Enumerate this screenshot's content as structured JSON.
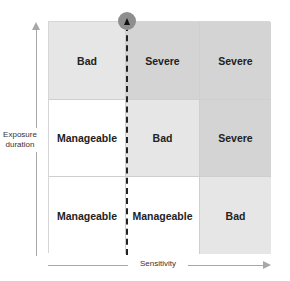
{
  "diagram": {
    "type": "risk-matrix",
    "y_axis": {
      "label": "Exposure duration",
      "label_lines": [
        "Exposure",
        "duration"
      ]
    },
    "x_axis": {
      "label": "Sensitivity"
    },
    "rows": [
      {
        "cells": [
          {
            "label": "Bad",
            "level": "bad"
          },
          {
            "label": "Severe",
            "level": "severe"
          },
          {
            "label": "Severe",
            "level": "severe"
          }
        ]
      },
      {
        "cells": [
          {
            "label": "Manageable",
            "level": "manageable"
          },
          {
            "label": "Bad",
            "level": "bad"
          },
          {
            "label": "Severe",
            "level": "severe"
          }
        ]
      },
      {
        "cells": [
          {
            "label": "Manageable",
            "level": "manageable"
          },
          {
            "label": "Manageable",
            "level": "manageable"
          },
          {
            "label": "Bad",
            "level": "bad"
          }
        ]
      }
    ],
    "colors": {
      "manageable": "#ffffff",
      "bad": "#e6e6e6",
      "severe": "#d4d4d4",
      "marker": "#8e8e8e",
      "axis": "#a8a8a8"
    },
    "marker": {
      "shape": "circle-with-up-triangle",
      "position": "top of dashed line between column 1 and 2"
    }
  }
}
